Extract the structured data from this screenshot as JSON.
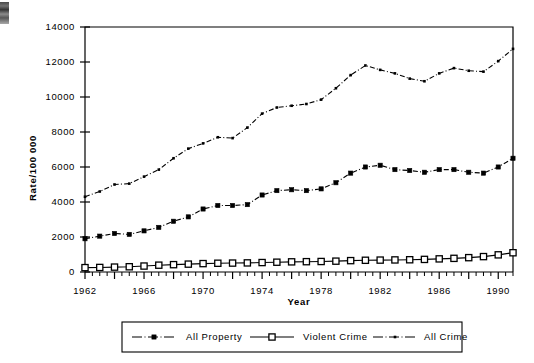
{
  "chart_data": {
    "type": "line",
    "title": "",
    "xlabel": "Year",
    "ylabel": "Rate/100 000",
    "xlim": [
      1962,
      1991
    ],
    "ylim": [
      0,
      14000
    ],
    "grid": false,
    "legend_position": "bottom",
    "x": [
      1962,
      1963,
      1964,
      1965,
      1966,
      1967,
      1968,
      1969,
      1970,
      1971,
      1972,
      1973,
      1974,
      1975,
      1976,
      1977,
      1978,
      1979,
      1980,
      1981,
      1982,
      1983,
      1984,
      1985,
      1986,
      1987,
      1988,
      1989,
      1990,
      1991
    ],
    "xticks_major": [
      1962,
      1966,
      1970,
      1974,
      1978,
      1982,
      1986,
      1990
    ],
    "xticklabels": [
      "1962",
      "1966",
      "1970",
      "1974",
      "1978",
      "1982",
      "1986",
      "1990"
    ],
    "yticks": [
      0,
      2000,
      4000,
      6000,
      8000,
      10000,
      12000,
      14000
    ],
    "yticklabels": [
      "0",
      "2000",
      "4000",
      "6000",
      "8000",
      "10000",
      "12000",
      "14000"
    ],
    "series": [
      {
        "name": "All  Property",
        "marker": "filled-square",
        "linestyle": "dash-dot",
        "color": "#000000",
        "values": [
          1900,
          2050,
          2200,
          2150,
          2350,
          2550,
          2900,
          3150,
          3600,
          3800,
          3800,
          3850,
          4400,
          4650,
          4700,
          4650,
          4750,
          5100,
          5650,
          6000,
          6100,
          5850,
          5800,
          5700,
          5850,
          5850,
          5700,
          5650,
          6000,
          6500
        ]
      },
      {
        "name": "Violent  Crime",
        "marker": "open-square",
        "linestyle": "solid",
        "color": "#000000",
        "values": [
          250,
          260,
          280,
          300,
          340,
          390,
          420,
          450,
          480,
          500,
          510,
          520,
          540,
          560,
          580,
          590,
          600,
          620,
          650,
          670,
          680,
          690,
          700,
          720,
          750,
          780,
          820,
          880,
          980,
          1100
        ]
      },
      {
        "name": "All  Crime",
        "marker": "dot",
        "linestyle": "dash-dot",
        "color": "#000000",
        "values": [
          4300,
          4600,
          5000,
          5050,
          5450,
          5850,
          6500,
          7050,
          7350,
          7700,
          7650,
          8250,
          9050,
          9400,
          9500,
          9600,
          9850,
          10500,
          11250,
          11800,
          11550,
          11350,
          11050,
          10900,
          11350,
          11650,
          11500,
          11450,
          12050,
          12750
        ]
      }
    ]
  },
  "legend": {
    "items": [
      {
        "label": "All  Property",
        "marker": "filled-square"
      },
      {
        "label": "Violent  Crime",
        "marker": "open-square"
      },
      {
        "label": "All  Crime",
        "marker": "dot"
      }
    ]
  },
  "axes": {
    "y_title": "Rate/100 000",
    "x_title": "Year"
  }
}
